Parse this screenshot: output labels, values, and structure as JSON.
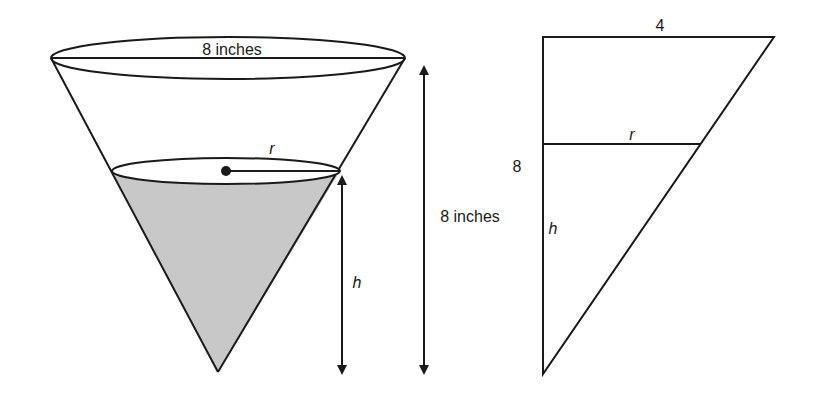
{
  "cone_figure": {
    "top_diameter_label": "8 inches",
    "height_label": "8 inches",
    "radius_label": "r",
    "water_height_label": "h",
    "water_fill_color": "#c8c8c8",
    "stroke_color": "#1a1a1a"
  },
  "triangle_figure": {
    "top_label": "4",
    "side_label": "8",
    "radius_label": "r",
    "height_label": "h"
  }
}
